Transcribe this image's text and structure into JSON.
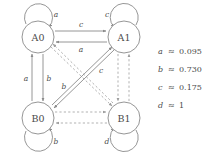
{
  "figure": {
    "kind": "state-transition-diagram",
    "background_color": "#ffffff",
    "line_color": "#8a8a8a",
    "dashed_line_color": "#a8a8a8",
    "text_color": "#4a4a4a"
  },
  "nodes": [
    {
      "id": "A0",
      "label": "A0",
      "cx": 38,
      "cy": 37,
      "r": 16
    },
    {
      "id": "A1",
      "label": "A1",
      "cx": 124,
      "cy": 37,
      "r": 16
    },
    {
      "id": "B0",
      "label": "B0",
      "cx": 38,
      "cy": 118,
      "r": 16
    },
    {
      "id": "B1",
      "label": "B1",
      "cx": 124,
      "cy": 118,
      "r": 16
    }
  ],
  "self_loops": [
    {
      "node": "A0",
      "label": "a",
      "label_x": 56,
      "label_y": 14,
      "direction": "up-left"
    },
    {
      "node": "A1",
      "label": "c",
      "label_x": 107,
      "label_y": 14,
      "direction": "up-right"
    },
    {
      "node": "B0",
      "label": "b",
      "label_x": 56,
      "label_y": 141,
      "direction": "down-left"
    },
    {
      "node": "B1",
      "label": "d",
      "label_x": 107,
      "label_y": 141,
      "direction": "down-right"
    }
  ],
  "edges": [
    {
      "from": "A0",
      "to": "A1",
      "label": "c",
      "label_x": 81,
      "label_y": 24,
      "style": "solid",
      "position": "top-upper"
    },
    {
      "from": "A1",
      "to": "A0",
      "label": "a",
      "label_x": 81,
      "label_y": 48,
      "style": "solid",
      "position": "top-lower"
    },
    {
      "from": "B0",
      "to": "A0",
      "label": "a",
      "label_x": 27,
      "label_y": 78,
      "style": "solid",
      "position": "left-outer"
    },
    {
      "from": "A0",
      "to": "B0",
      "label": "b",
      "label_x": 48,
      "label_y": 78,
      "style": "solid",
      "position": "left-inner"
    },
    {
      "from": "B0",
      "to": "A1",
      "label": "c",
      "label_x": 101,
      "label_y": 70,
      "style": "solid",
      "position": "diagonal-up"
    },
    {
      "from": "A1",
      "to": "B0",
      "label": "b",
      "label_x": 64,
      "label_y": 86,
      "style": "solid",
      "position": "diagonal-down"
    },
    {
      "from": "A1",
      "to": "B1",
      "label": "",
      "label_x": 0,
      "label_y": 0,
      "style": "dashed",
      "position": "right-outer"
    },
    {
      "from": "B1",
      "to": "A1",
      "label": "",
      "label_x": 0,
      "label_y": 0,
      "style": "dashed",
      "position": "right-inner"
    },
    {
      "from": "B0",
      "to": "B1",
      "label": "",
      "label_x": 0,
      "label_y": 0,
      "style": "dashed",
      "position": "bottom-upper"
    },
    {
      "from": "B1",
      "to": "B0",
      "label": "",
      "label_x": 0,
      "label_y": 0,
      "style": "dashed",
      "position": "bottom-lower"
    },
    {
      "from": "A0",
      "to": "B1",
      "label": "",
      "label_x": 0,
      "label_y": 0,
      "style": "dashed",
      "position": "diagonal-dn"
    },
    {
      "from": "B1",
      "to": "A0",
      "label": "",
      "label_x": 0,
      "label_y": 0,
      "style": "dashed",
      "position": "diagonal-up2"
    }
  ],
  "legend": {
    "items": [
      {
        "symbol": "a",
        "relation": "≈",
        "value": "0.095"
      },
      {
        "symbol": "b",
        "relation": "≈",
        "value": "0.730"
      },
      {
        "symbol": "c",
        "relation": "≈",
        "value": "0.175"
      },
      {
        "symbol": "d",
        "relation": "≈",
        "value": "1"
      }
    ]
  }
}
